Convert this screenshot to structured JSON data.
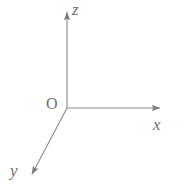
{
  "figure": {
    "kind": "3d-coordinate-axes-diagram",
    "background_color": "#ffffff",
    "stroke_color": "#8a8a8a",
    "label_color": "#6f6f6f",
    "width": 184,
    "height": 190,
    "origin_label": "O",
    "axis_labels": {
      "x": "x",
      "y": "y",
      "z": "z"
    }
  },
  "chart_data": {
    "type": "scatter",
    "title": "",
    "subtitle": "",
    "xlabel": "x",
    "ylabel": "y",
    "zlabel": "z",
    "grid": false,
    "legend": "none",
    "annotations": [
      "O",
      "x",
      "y",
      "z"
    ],
    "series": [
      {
        "name": "z-axis",
        "label": "z",
        "from": [
          67,
          108
        ],
        "to": [
          67,
          8
        ],
        "arrow": "end",
        "direction": "up"
      },
      {
        "name": "x-axis",
        "label": "x",
        "from": [
          67,
          108
        ],
        "to": [
          164,
          108
        ],
        "arrow": "end",
        "direction": "right"
      },
      {
        "name": "y-axis",
        "label": "y",
        "from": [
          67,
          108
        ],
        "to": [
          30,
          178
        ],
        "arrow": "end",
        "direction": "down-left"
      }
    ],
    "points": [
      {
        "name": "origin",
        "label": "O",
        "x": 67,
        "y": 108
      }
    ]
  }
}
